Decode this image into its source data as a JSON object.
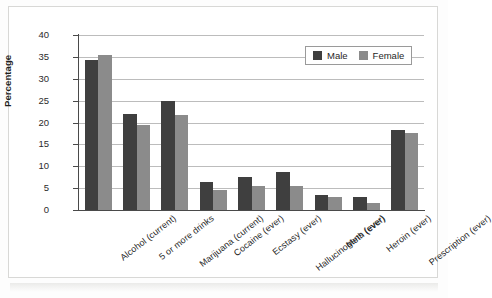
{
  "chart_data": {
    "type": "bar",
    "title": "",
    "xlabel": "",
    "ylabel": "Percentage",
    "ylim": [
      0,
      40
    ],
    "ytick_step": 5,
    "yticks": [
      40,
      35,
      30,
      25,
      20,
      15,
      10,
      5,
      0
    ],
    "grid": true,
    "legend_position": "top-right",
    "categories": [
      "Alcohol (current)",
      "5 or more drinks",
      "Marijuana (current)",
      "Cocaine (ever)",
      "Ecstasy (ever)",
      "Hallucinogens (ever)",
      "Meth (ever)",
      "Heroin (ever)",
      "Prescription (ever)"
    ],
    "series": [
      {
        "name": "Male",
        "color": "#3f3f3f",
        "values": [
          34.3,
          22.0,
          25.0,
          6.5,
          7.5,
          8.8,
          3.4,
          2.9,
          18.4
        ]
      },
      {
        "name": "Female",
        "color": "#8b8b8b",
        "values": [
          35.5,
          19.5,
          21.8,
          4.5,
          5.5,
          5.5,
          3.0,
          1.6,
          17.5
        ]
      }
    ]
  },
  "legend": {
    "items": [
      {
        "label": "Male",
        "color": "#3f3f3f"
      },
      {
        "label": "Female",
        "color": "#8b8b8b"
      }
    ]
  }
}
